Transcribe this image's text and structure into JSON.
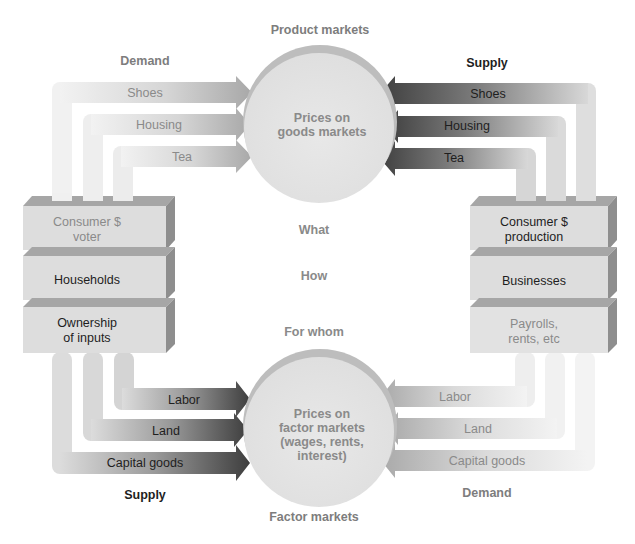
{
  "title_top": "Product markets",
  "title_bottom": "Factor markets",
  "product_circle": {
    "line1": "Prices on",
    "line2": "goods markets"
  },
  "factor_circle": {
    "line1": "Prices on",
    "line2": "factor markets",
    "line3": "(wages, rents,",
    "line4": "interest)"
  },
  "center_questions": {
    "what": "What",
    "how": "How",
    "for_whom": "For whom"
  },
  "product_side": {
    "demand_label": "Demand",
    "supply_label": "Supply",
    "demand_arrows": [
      "Shoes",
      "Housing",
      "Tea"
    ],
    "supply_arrows": [
      "Shoes",
      "Housing",
      "Tea"
    ]
  },
  "factor_side": {
    "supply_label": "Supply",
    "demand_label": "Demand",
    "supply_arrows": [
      "Labor",
      "Land",
      "Capital goods"
    ],
    "demand_arrows": [
      "Labor",
      "Land",
      "Capital goods"
    ]
  },
  "households_stack": {
    "top": {
      "line1": "Consumer $",
      "line2": "voter"
    },
    "middle": "Households",
    "bottom": {
      "line1": "Ownership",
      "line2": "of inputs"
    }
  },
  "businesses_stack": {
    "top": {
      "line1": "Consumer $",
      "line2": "production"
    },
    "middle": "Businesses",
    "bottom": {
      "line1": "Payrolls,",
      "line2": "rents, etc"
    }
  },
  "colors": {
    "block_face": "#dcdcdc",
    "block_top": "#a9a9a9",
    "block_side": "#8c8c8c",
    "circle_fill": "#e4e4e4",
    "circle_rim": "#b9b9b9",
    "arrow_light": "#ececec",
    "arrow_dark": "#4a4a4a"
  }
}
